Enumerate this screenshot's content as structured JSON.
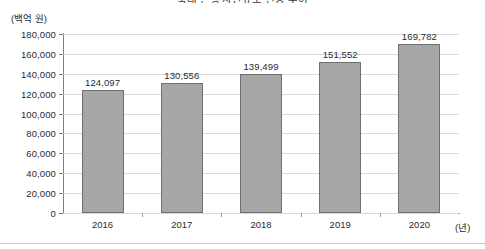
{
  "chart_data": {
    "type": "bar",
    "title": "국내 은행 자산규모 변동 추이",
    "categories": [
      "2016",
      "2017",
      "2018",
      "2019",
      "2020"
    ],
    "values": [
      124097,
      130556,
      139499,
      151552,
      169782
    ],
    "value_labels": [
      "124,097",
      "130,556",
      "139,499",
      "151,552",
      "169,782"
    ],
    "xlabel": "(년)",
    "ylabel": "(백억 원)",
    "ylim": [
      0,
      180000
    ],
    "ytick_values": [
      0,
      20000,
      40000,
      60000,
      80000,
      100000,
      120000,
      140000,
      160000,
      180000
    ],
    "ytick_labels": [
      "0",
      "20,000",
      "40,000",
      "60,000",
      "80,000",
      "100,000",
      "120,000",
      "140,000",
      "160,000",
      "180,000"
    ],
    "grid": true,
    "legend": null,
    "bar_color": "#a6a6a6",
    "bar_border_color": "#6f6f6f",
    "gridline_color": "#d9d9d9",
    "axis_color": "#7d7d7d"
  }
}
